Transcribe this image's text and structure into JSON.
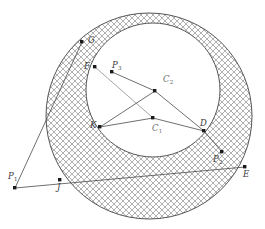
{
  "figure": {
    "width": 265,
    "height": 229,
    "background_color": "#ffffff",
    "stroke_color": "#4a4a4a",
    "hatch_color": "#9a9a9a",
    "label_color": "#3a3a3a",
    "center_label_color": "#6e6e6e"
  },
  "circles": [
    {
      "name": "outer-circle",
      "center_label": "C2",
      "cx": 149,
      "cy": 116,
      "r": 103,
      "fill": "hatched"
    },
    {
      "name": "inner-circle",
      "center_label": "C1",
      "cx": 153,
      "cy": 90,
      "r": 67,
      "fill": "white"
    }
  ],
  "points": [
    {
      "id": "G",
      "label": "G",
      "sub": "",
      "x": 82,
      "y": 42,
      "label_x": 88,
      "label_y": 36,
      "on": "outer-circle"
    },
    {
      "id": "F",
      "label": "F",
      "sub": "",
      "x": 95,
      "y": 67,
      "label_x": 84,
      "label_y": 62,
      "on": "inner-circle"
    },
    {
      "id": "P3",
      "label": "P",
      "sub": "3",
      "x": 112,
      "y": 72,
      "label_x": 112,
      "label_y": 61,
      "on": "chord"
    },
    {
      "id": "C2",
      "label": "C",
      "sub": "2",
      "x": 155,
      "y": 91,
      "label_x": 163,
      "label_y": 75,
      "on": "center"
    },
    {
      "id": "K",
      "label": "K",
      "sub": "",
      "x": 100,
      "y": 127,
      "label_x": 90,
      "label_y": 121,
      "on": "inner-circle"
    },
    {
      "id": "C1",
      "label": "C",
      "sub": "1",
      "x": 153,
      "y": 118,
      "label_x": 152,
      "label_y": 124,
      "on": "center"
    },
    {
      "id": "D",
      "label": "D",
      "sub": "",
      "x": 204,
      "y": 131,
      "label_x": 200,
      "label_y": 119,
      "on": "inner-circle"
    },
    {
      "id": "P2",
      "label": "P",
      "sub": "2",
      "x": 222,
      "y": 152,
      "label_x": 213,
      "label_y": 155,
      "on": "chord"
    },
    {
      "id": "E",
      "label": "E",
      "sub": "",
      "x": 245,
      "y": 167,
      "label_x": 243,
      "label_y": 170,
      "on": "outer-circle"
    },
    {
      "id": "J",
      "label": "J",
      "sub": "",
      "x": 60,
      "y": 180,
      "label_x": 57,
      "label_y": 183,
      "on": "outer-circle"
    },
    {
      "id": "P1",
      "label": "P",
      "sub": "1",
      "x": 15,
      "y": 188,
      "label_x": 8,
      "label_y": 172,
      "on": "external"
    }
  ],
  "segments": [
    {
      "name": "p1-to-f",
      "from": "P1",
      "to": "G",
      "x1": 15,
      "y1": 188,
      "x2": 82,
      "y2": 42,
      "color": "#4a4a4a"
    },
    {
      "name": "p1-to-d",
      "from": "P1",
      "to": "E",
      "x1": 15,
      "y1": 188,
      "x2": 245,
      "y2": 167,
      "color": "#4a4a4a"
    },
    {
      "name": "f-to-c1",
      "from": "F",
      "to": "C1",
      "x1": 95,
      "y1": 67,
      "x2": 153,
      "y2": 118,
      "color": "#9b9b9b"
    },
    {
      "name": "k-to-c2",
      "from": "K",
      "to": "C2",
      "x1": 100,
      "y1": 127,
      "x2": 155,
      "y2": 91,
      "color": "#4a4a4a"
    },
    {
      "name": "c2-to-d",
      "from": "C2",
      "to": "D",
      "x1": 155,
      "y1": 91,
      "x2": 204,
      "y2": 131,
      "color": "#4a4a4a"
    },
    {
      "name": "c1-to-d",
      "from": "C1",
      "to": "D",
      "x1": 153,
      "y1": 118,
      "x2": 204,
      "y2": 131,
      "color": "#4a4a4a"
    },
    {
      "name": "c1-to-k",
      "from": "C1",
      "to": "K",
      "x1": 153,
      "y1": 118,
      "x2": 100,
      "y2": 127,
      "color": "#4a4a4a"
    },
    {
      "name": "p3-to-c2",
      "from": "P3",
      "to": "C2",
      "x1": 112,
      "y1": 72,
      "x2": 155,
      "y2": 91,
      "color": "#4a4a4a"
    }
  ]
}
